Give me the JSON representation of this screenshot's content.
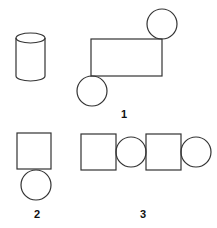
{
  "diagram": {
    "stroke_color": "#333333",
    "background": "#ffffff",
    "figures": [
      {
        "id": "cylinder",
        "label": ""
      },
      {
        "id": "figure-1",
        "label": "1"
      },
      {
        "id": "figure-2",
        "label": "2"
      },
      {
        "id": "figure-3",
        "label": "3"
      }
    ]
  }
}
